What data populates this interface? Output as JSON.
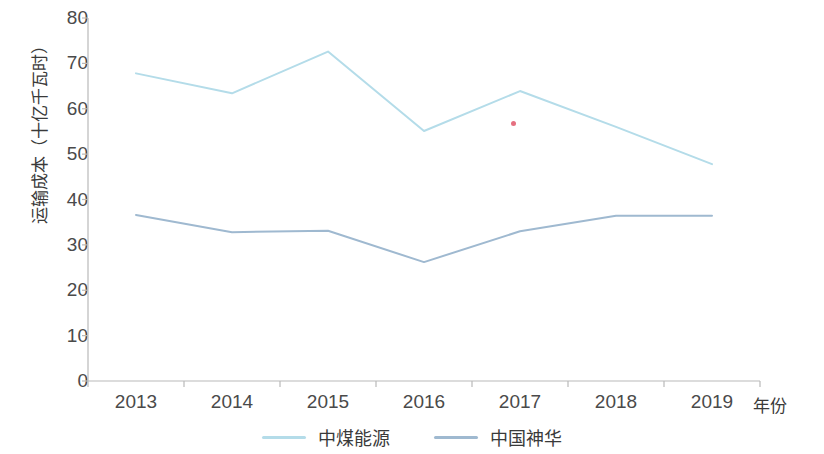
{
  "chart_data": {
    "type": "line",
    "title": "",
    "subtitle": "",
    "xlabel": "年份",
    "ylabel": "运输成本（十亿千瓦时）",
    "categories": [
      "2013",
      "2014",
      "2015",
      "2016",
      "2017",
      "2018",
      "2019"
    ],
    "x": [
      2013,
      2014,
      2015,
      2016,
      2017,
      2018,
      2019
    ],
    "ylim": [
      0,
      80
    ],
    "ytick_labels": [
      "0",
      "10",
      "20",
      "30",
      "40",
      "50",
      "60",
      "70",
      "80"
    ],
    "ytick_values": [
      0,
      10,
      20,
      30,
      40,
      50,
      60,
      70,
      80
    ],
    "grid": false,
    "legend_position": "bottom",
    "series": [
      {
        "name": "中煤能源",
        "color": "#b4dce9",
        "values": [
          67.8,
          63.4,
          72.6,
          55.1,
          63.9,
          56.0,
          47.8
        ]
      },
      {
        "name": "中国神华",
        "color": "#9fb9d0",
        "values": [
          36.6,
          32.8,
          33.1,
          26.2,
          33.0,
          36.4,
          36.4
        ]
      }
    ],
    "annotations": [
      {
        "name": "red-speck",
        "x_px": 513,
        "y_px": 123,
        "color": "#e0566a"
      }
    ]
  },
  "axis": {
    "y_label_text": "运输成本（十亿千瓦时）",
    "x_label_text": "年份",
    "axis_color": "#b9b9b9"
  },
  "legend": {
    "items": [
      {
        "label": "中煤能源",
        "color": "#b4dce9"
      },
      {
        "label": "中国神华",
        "color": "#9fb9d0"
      }
    ]
  }
}
